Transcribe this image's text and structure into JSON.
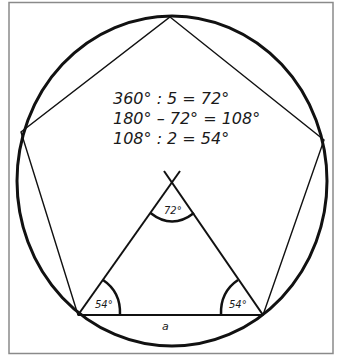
{
  "diagram": {
    "equations": [
      "360° : 5 = 72°",
      "180° – 72° = 108°",
      "108° : 2 = 54°"
    ],
    "angles": {
      "apex": "72°",
      "base_left": "54°",
      "base_right": "54°"
    },
    "side_label": "a",
    "colors": {
      "frame": "#8a8a8a",
      "stroke": "#111111",
      "background": "#ffffff"
    }
  }
}
